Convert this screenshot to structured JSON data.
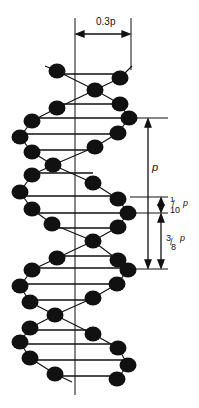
{
  "diagram": {
    "labels": {
      "width": "0.3p",
      "pitch": "p",
      "rise_num": "1",
      "rise_den": "10",
      "rise_var": "p",
      "groove_num": "3",
      "groove_den": "8",
      "groove_var": "p"
    },
    "colors": {
      "ink": "#111111",
      "background": "#ffffff"
    },
    "axis_x": 75,
    "helix_right_x": 130,
    "balls": [
      [
        57,
        71
      ],
      [
        120,
        78
      ],
      [
        95,
        90
      ],
      [
        120,
        104
      ],
      [
        57,
        108
      ],
      [
        32,
        121
      ],
      [
        129,
        118
      ],
      [
        20,
        137
      ],
      [
        118,
        133
      ],
      [
        32,
        152
      ],
      [
        95,
        147
      ],
      [
        53,
        165
      ],
      [
        32,
        175
      ],
      [
        93,
        183
      ],
      [
        20,
        192
      ],
      [
        118,
        199
      ],
      [
        32,
        209
      ],
      [
        128,
        213
      ],
      [
        52,
        224
      ],
      [
        118,
        227
      ],
      [
        93,
        241
      ],
      [
        57,
        258
      ],
      [
        118,
        260
      ],
      [
        32,
        270
      ],
      [
        128,
        270
      ],
      [
        20,
        286
      ],
      [
        117,
        284
      ],
      [
        30,
        302
      ],
      [
        93,
        298
      ],
      [
        55,
        315
      ],
      [
        30,
        328
      ],
      [
        93,
        334
      ],
      [
        20,
        342
      ],
      [
        118,
        348
      ],
      [
        30,
        358
      ],
      [
        128,
        365
      ],
      [
        55,
        374
      ],
      [
        117,
        379
      ]
    ],
    "rungs": [
      [
        57,
        74,
        120
      ],
      [
        57,
        104,
        120
      ],
      [
        32,
        118,
        129
      ],
      [
        20,
        134,
        118
      ],
      [
        32,
        150,
        95
      ],
      [
        32,
        173,
        93
      ],
      [
        20,
        196,
        118
      ],
      [
        32,
        213,
        128
      ],
      [
        52,
        228,
        118
      ],
      [
        57,
        256,
        118
      ],
      [
        32,
        268,
        128
      ],
      [
        20,
        284,
        117
      ],
      [
        30,
        300,
        93
      ],
      [
        30,
        330,
        93
      ],
      [
        20,
        344,
        118
      ],
      [
        30,
        360,
        128
      ],
      [
        55,
        376,
        117
      ]
    ],
    "backbones": [
      [
        [
          45,
          66
        ],
        [
          57,
          71
        ],
        [
          95,
          90
        ],
        [
          120,
          104
        ]
      ],
      [
        [
          132,
          66
        ],
        [
          120,
          78
        ],
        [
          95,
          90
        ],
        [
          57,
          108
        ],
        [
          32,
          121
        ],
        [
          20,
          137
        ],
        [
          32,
          152
        ],
        [
          53,
          165
        ],
        [
          93,
          183
        ],
        [
          118,
          199
        ],
        [
          128,
          213
        ],
        [
          118,
          227
        ],
        [
          93,
          241
        ],
        [
          57,
          258
        ],
        [
          32,
          270
        ],
        [
          20,
          286
        ],
        [
          30,
          302
        ],
        [
          55,
          315
        ],
        [
          93,
          334
        ],
        [
          118,
          348
        ],
        [
          128,
          365
        ],
        [
          117,
          379
        ]
      ],
      [
        [
          120,
          104
        ],
        [
          129,
          118
        ],
        [
          118,
          133
        ],
        [
          95,
          147
        ],
        [
          53,
          165
        ],
        [
          32,
          175
        ],
        [
          20,
          192
        ],
        [
          32,
          209
        ],
        [
          52,
          224
        ],
        [
          93,
          241
        ],
        [
          118,
          260
        ],
        [
          128,
          270
        ],
        [
          117,
          284
        ],
        [
          93,
          298
        ],
        [
          55,
          315
        ],
        [
          30,
          328
        ],
        [
          20,
          342
        ],
        [
          30,
          358
        ],
        [
          55,
          374
        ],
        [
          72,
          382
        ]
      ]
    ]
  }
}
